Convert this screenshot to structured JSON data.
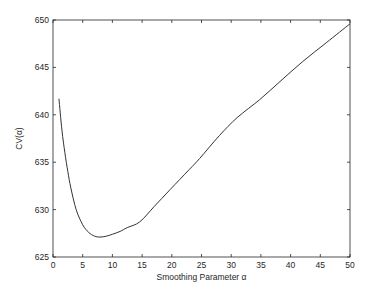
{
  "chart_data": {
    "type": "line",
    "title": "",
    "xlabel": "Smoothing Parameter α",
    "ylabel": "CV(α)",
    "xlim": [
      0,
      50
    ],
    "ylim": [
      625,
      650
    ],
    "xticks": [
      0,
      5,
      10,
      15,
      20,
      25,
      30,
      35,
      40,
      45,
      50
    ],
    "yticks": [
      625,
      630,
      635,
      640,
      645,
      650
    ],
    "grid": false,
    "legend": null,
    "series": [
      {
        "name": "CV(α)",
        "color": "#333333",
        "x": [
          1.0,
          1.5,
          2.0,
          2.5,
          3.0,
          3.9,
          5.0,
          6.0,
          7.0,
          7.9,
          9.0,
          10.0,
          11.3,
          12.5,
          14.6,
          17.0,
          19.7,
          22.9,
          24.7,
          28.0,
          31.0,
          34.8,
          38.2,
          42.0,
          46.0,
          50.0
        ],
        "values": [
          641.7,
          638.4,
          636.0,
          634.0,
          632.3,
          630.0,
          628.4,
          627.6,
          627.2,
          627.1,
          627.2,
          627.4,
          627.7,
          628.1,
          628.7,
          630.3,
          632.1,
          634.2,
          635.4,
          637.8,
          639.7,
          641.6,
          643.5,
          645.6,
          647.6,
          649.6
        ]
      }
    ]
  },
  "plot": {
    "left": 53,
    "top": 20,
    "right": 350,
    "bottom": 257
  }
}
